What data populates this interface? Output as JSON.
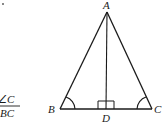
{
  "diagram": {
    "type": "isosceles-triangle-with-altitude",
    "stroke_color": "#1a1a1a",
    "background": "#ffffff",
    "points": {
      "A": {
        "label": "A",
        "x": 107,
        "y": 12
      },
      "B": {
        "label": "B",
        "x": 60,
        "y": 109
      },
      "C": {
        "label": "C",
        "x": 152,
        "y": 109
      },
      "D": {
        "label": "D",
        "x": 106,
        "y": 109
      }
    },
    "segments": [
      "AB",
      "AC",
      "BC",
      "AD"
    ],
    "markers": {
      "right_angle_at": "D",
      "angle_arcs_at": [
        "B",
        "C"
      ]
    },
    "labels": {
      "A": "A",
      "B": "B",
      "C": "C",
      "D": "D"
    }
  },
  "margin_text": {
    "fraction_numerator": "∠C",
    "fraction_denominator": "BC",
    "top_left_mark": "."
  }
}
